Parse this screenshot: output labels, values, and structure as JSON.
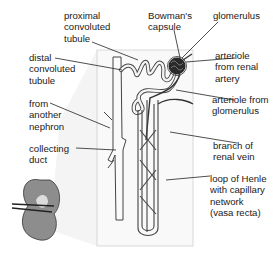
{
  "diagram": {
    "labels": {
      "proximal": "proximal\nconvoluted\ntubule",
      "bowman": "Bowman's\ncapsule",
      "glomerulus": "glomerulus",
      "distal": "distal\nconvoluted\ntubule",
      "arteriole_in": "arteriole\nfrom renal\nartery",
      "from_nephron": "from\nanother\nnephron",
      "arteriole_out": "arteriole from\nglomerulus",
      "collecting": "collecting\nduct",
      "vein": "branch of\nrenal vein",
      "henle": "loop of Henle\nwith capillary\nnetwork\n(vasa recta)"
    },
    "colors": {
      "line": "#333333",
      "tubule_fill": "#f2f2f2",
      "panel_bg": "#f7f7f7",
      "kidney": "#8a8a8a"
    }
  }
}
